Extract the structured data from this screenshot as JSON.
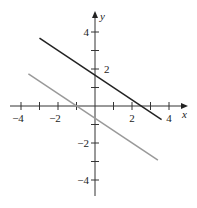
{
  "chart_data": {
    "type": "line",
    "title": "",
    "xlabel": "x",
    "ylabel": "y",
    "xlim": [
      -4.5,
      4.9
    ],
    "ylim": [
      -4.8,
      5.1
    ],
    "grid": false,
    "legend": null,
    "x_ticks": [
      -4,
      -3,
      -2,
      -1,
      1,
      2,
      3,
      4
    ],
    "y_ticks": [
      -4,
      -3,
      -2,
      -1,
      1,
      2,
      3,
      4
    ],
    "x_tick_labels": [
      {
        "value": -4,
        "label": "−4"
      },
      {
        "value": -2,
        "label": "−2"
      },
      {
        "value": 2,
        "label": "2"
      },
      {
        "value": 4,
        "label": "4"
      }
    ],
    "y_tick_labels": [
      {
        "value": 4,
        "label": "4"
      },
      {
        "value": 2,
        "label": "2"
      },
      {
        "value": -2,
        "label": "−2"
      },
      {
        "value": -4,
        "label": "−4"
      }
    ],
    "series": [
      {
        "name": "dark line",
        "color": "#222222",
        "equation": "y = -(2/3)x + 5/3",
        "x": [
          -3,
          3.6
        ],
        "y": [
          3.67,
          -0.73
        ]
      },
      {
        "name": "gray line",
        "color": "#999999",
        "equation": "y = -(2/3)x - 2/3",
        "x": [
          -3.6,
          3.4
        ],
        "y": [
          1.73,
          -2.93
        ]
      }
    ]
  }
}
